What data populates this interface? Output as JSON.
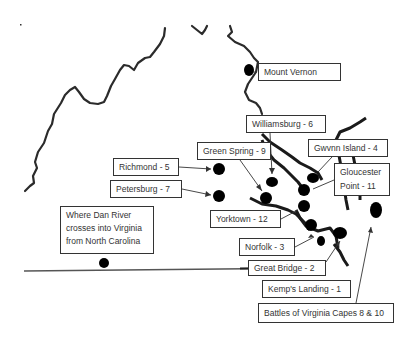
{
  "map": {
    "region": "Virginia",
    "colors": {
      "line": "#2b2b2b",
      "dot": "#000000",
      "label_border": "#333333",
      "label_text": "#333333"
    },
    "labels": [
      {
        "id": "mount-vernon",
        "text": "Mount Vernon",
        "x": 258,
        "y": 63,
        "w": 83,
        "h": 18
      },
      {
        "id": "williamsburg",
        "text": "Williamsburg - 6",
        "x": 246,
        "y": 115,
        "w": 80,
        "h": 18
      },
      {
        "id": "green-spring",
        "text": "Green Spring - 9",
        "x": 197,
        "y": 142,
        "w": 74,
        "h": 18
      },
      {
        "id": "gwynn-island",
        "text": "Gwvnn Island - 4",
        "x": 308,
        "y": 139,
        "w": 80,
        "h": 18
      },
      {
        "id": "gloucester-point",
        "text": "Gloucester Point - 11",
        "x": 334,
        "y": 163,
        "w": 56,
        "h": 33,
        "multi": true
      },
      {
        "id": "richmond",
        "text": "Richmond - 5",
        "x": 113,
        "y": 158,
        "w": 66,
        "h": 18
      },
      {
        "id": "petersburg",
        "text": "Petersburg - 7",
        "x": 110,
        "y": 180,
        "w": 72,
        "h": 18
      },
      {
        "id": "yorktown",
        "text": "Yorktown - 12",
        "x": 210,
        "y": 210,
        "w": 71,
        "h": 18
      },
      {
        "id": "dan-river",
        "text": "Where Dan River crosses into Virginia from North Carolina",
        "x": 60,
        "y": 206,
        "w": 94,
        "h": 48,
        "multi": true
      },
      {
        "id": "norfolk",
        "text": "Norfolk - 3",
        "x": 239,
        "y": 238,
        "w": 56,
        "h": 18
      },
      {
        "id": "great-bridge",
        "text": "Great Bridge - 2",
        "x": 248,
        "y": 260,
        "w": 78,
        "h": 16
      },
      {
        "id": "kemps-landing",
        "text": "Kemp's Landing - 1",
        "x": 262,
        "y": 280,
        "w": 89,
        "h": 18
      },
      {
        "id": "virginia-capes",
        "text": "Battles of Virginia Capes 8 & 10",
        "x": 258,
        "y": 303,
        "w": 136,
        "h": 20
      }
    ],
    "dots": [
      {
        "id": "mount-vernon",
        "x": 249,
        "y": 70,
        "rx": 5,
        "ry": 6
      },
      {
        "id": "richmond",
        "x": 219,
        "y": 169,
        "rx": 6,
        "ry": 6
      },
      {
        "id": "petersburg",
        "x": 219,
        "y": 196,
        "rx": 6,
        "ry": 6
      },
      {
        "id": "williamsburg",
        "x": 272,
        "y": 182,
        "rx": 6,
        "ry": 5
      },
      {
        "id": "green-spring",
        "x": 266,
        "y": 198,
        "rx": 6,
        "ry": 6
      },
      {
        "id": "gwynn-island",
        "x": 313,
        "y": 178,
        "rx": 6,
        "ry": 5
      },
      {
        "id": "gloucester-point",
        "x": 304,
        "y": 190,
        "rx": 6,
        "ry": 6
      },
      {
        "id": "yorktown",
        "x": 304,
        "y": 206,
        "rx": 6,
        "ry": 6
      },
      {
        "id": "capes-a",
        "x": 376,
        "y": 210,
        "rx": 6,
        "ry": 8
      },
      {
        "id": "norfolk",
        "x": 311,
        "y": 225,
        "rx": 6,
        "ry": 6
      },
      {
        "id": "kemps-landing",
        "x": 340,
        "y": 233,
        "rx": 7,
        "ry": 6
      },
      {
        "id": "great-bridge",
        "x": 321,
        "y": 241,
        "rx": 4,
        "ry": 5
      },
      {
        "id": "dan-river",
        "x": 104,
        "y": 263,
        "rx": 5,
        "ry": 5
      }
    ]
  }
}
